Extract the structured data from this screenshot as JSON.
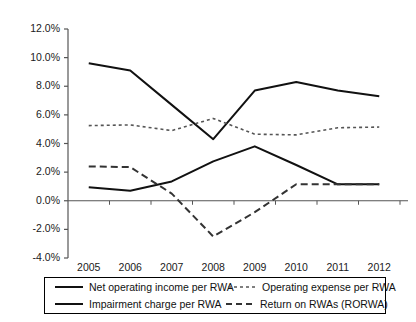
{
  "chart_data": {
    "type": "line",
    "title": "",
    "xlabel": "",
    "ylabel": "",
    "x": [
      2005,
      2006,
      2007,
      2008,
      2009,
      2010,
      2011,
      2012
    ],
    "categories": [
      "2005",
      "2006",
      "2007",
      "2008",
      "2009",
      "2010",
      "2011",
      "2012"
    ],
    "ylim": [
      -4.0,
      12.0
    ],
    "ytick_labels": [
      "12.0%",
      "10.0%",
      "8.0%",
      "6.0%",
      "4.0%",
      "2.0%",
      "0.0%",
      "-2.0%",
      "-4.0%"
    ],
    "ytick_values": [
      12.0,
      10.0,
      8.0,
      6.0,
      4.0,
      2.0,
      0.0,
      -2.0,
      -4.0
    ],
    "grid": false,
    "legend_position": "bottom",
    "zero_line": true,
    "units": "percent",
    "series": [
      {
        "name": "Net operating income per RWA",
        "style": "solid",
        "color": "#111111",
        "width": 2.0,
        "values": [
          9.6,
          9.1,
          6.7,
          4.3,
          7.7,
          8.3,
          7.7,
          7.3
        ]
      },
      {
        "name": "Operating expense per RWA",
        "style": "fine-dashed",
        "color": "#555555",
        "width": 1.6,
        "values": [
          5.25,
          5.3,
          4.9,
          5.75,
          4.65,
          4.6,
          5.1,
          5.15
        ]
      },
      {
        "name": "Impairment charge per RWA",
        "style": "solid",
        "color": "#111111",
        "width": 2.0,
        "values": [
          0.95,
          0.7,
          1.35,
          2.75,
          3.8,
          2.5,
          1.15,
          1.15
        ]
      },
      {
        "name": "Return on RWAs (RORWA)",
        "style": "long-dashed",
        "color": "#333333",
        "width": 2.0,
        "values": [
          2.4,
          2.35,
          0.5,
          -2.5,
          -0.8,
          1.15,
          1.15,
          1.15
        ]
      }
    ]
  },
  "legend": {
    "entries": [
      {
        "label": "Net operating income per RWA",
        "swatch": "solid-line-swatch"
      },
      {
        "label": "Operating expense per RWA",
        "swatch": "fine-dashed-line-swatch"
      },
      {
        "label": "Impairment charge per RWA",
        "swatch": "solid-line-swatch"
      },
      {
        "label": "Return on RWAs (RORWA)",
        "swatch": "long-dashed-line-swatch"
      }
    ]
  },
  "axis": {
    "axis_color": "#555555",
    "text_color": "#1a1a1a"
  }
}
